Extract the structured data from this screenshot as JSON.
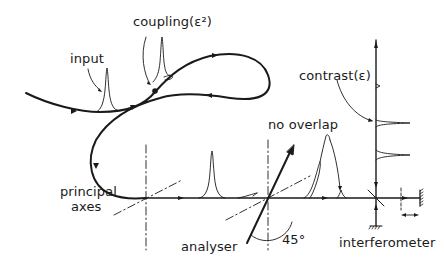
{
  "diagram": {
    "type": "optical fiber polarization coupling schematic",
    "labels": {
      "input": "input",
      "coupling": "coupling(ε²)",
      "contrast": "contrast(ε)",
      "no_overlap": "no overlap",
      "principal_axes_line1": "principal",
      "principal_axes_line2": "axes",
      "analyser": "analyser",
      "angle": "45°",
      "interferometer": "interferometer"
    },
    "colors": {
      "ink": "#1a1a1a",
      "background": "#ffffff"
    }
  }
}
